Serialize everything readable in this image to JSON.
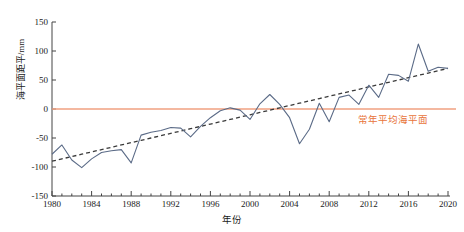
{
  "chart_data": {
    "type": "line",
    "title": "",
    "xlabel": "年份",
    "ylabel": "海平面距平/mm",
    "xlim": [
      1980,
      2020
    ],
    "ylim": [
      -150,
      150
    ],
    "grid": false,
    "legend_position": "none",
    "x_ticks": [
      1980,
      1984,
      1988,
      1992,
      1996,
      2000,
      2004,
      2008,
      2012,
      2016,
      2020
    ],
    "y_ticks": [
      150,
      100,
      50,
      0,
      -50,
      -100,
      -150
    ],
    "x": [
      1980,
      1981,
      1982,
      1983,
      1984,
      1985,
      1986,
      1987,
      1988,
      1989,
      1990,
      1991,
      1992,
      1993,
      1994,
      1995,
      1996,
      1997,
      1998,
      1999,
      2000,
      2001,
      2002,
      2003,
      2004,
      2005,
      2006,
      2007,
      2008,
      2009,
      2010,
      2011,
      2012,
      2013,
      2014,
      2015,
      2016,
      2017,
      2018,
      2019,
      2020
    ],
    "series": [
      {
        "name": "海平面距平",
        "type": "line",
        "color": "#5b6b87",
        "style": "solid",
        "values": [
          -78,
          -62,
          -88,
          -101,
          -86,
          -75,
          -72,
          -70,
          -93,
          -45,
          -40,
          -37,
          -32,
          -33,
          -48,
          -30,
          -15,
          -3,
          2,
          -2,
          -18,
          9,
          25,
          8,
          -15,
          -60,
          -35,
          10,
          -22,
          20,
          24,
          8,
          41,
          20,
          60,
          58,
          48,
          112,
          65,
          72,
          70
        ]
      },
      {
        "name": "线性趋势",
        "type": "line",
        "color": "#3a3a3a",
        "style": "dashed",
        "values": [
          -90,
          -86,
          -82,
          -78,
          -74,
          -70,
          -66,
          -62,
          -58,
          -54,
          -50,
          -46,
          -42,
          -38,
          -34,
          -30,
          -26,
          -22,
          -18,
          -14,
          -10,
          -6,
          -2,
          2,
          6,
          10,
          14,
          18,
          22,
          26,
          30,
          34,
          38,
          42,
          46,
          50,
          54,
          58,
          62,
          66,
          70
        ]
      }
    ],
    "reference_line": {
      "name": "常年平均海平面",
      "value": 0,
      "color": "#f0a080",
      "label": "常年平均海平面",
      "label_color": "#e8743b"
    }
  },
  "axis": {
    "y_title": "海平面距平/mm",
    "x_title": "年份"
  }
}
